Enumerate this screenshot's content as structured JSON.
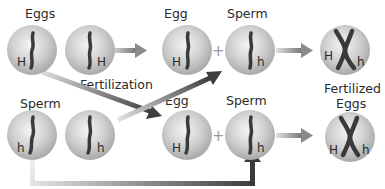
{
  "labels": {
    "eggs": "Eggs",
    "sperm_left": "Sperm",
    "fertilization": "Fertilization",
    "egg_top": "Egg",
    "sperm_top": "Sperm",
    "egg_bottom": "Egg",
    "sperm_bottom": "Sperm",
    "fertilized_line1": "Fertilized",
    "fertilized_line2": "Eggs",
    "plus": "+"
  },
  "cells": {
    "egg1": {
      "allele": "H"
    },
    "egg2": {
      "allele": "H"
    },
    "sperm1": {
      "allele": "h"
    },
    "sperm2": {
      "allele": "h"
    },
    "top_egg": {
      "allele": "H"
    },
    "top_sperm": {
      "allele": "h"
    },
    "bottom_egg": {
      "allele": "H"
    },
    "bottom_sperm": {
      "allele": "h"
    },
    "zygote_top": {
      "allele_left": "H",
      "allele_right": "h"
    },
    "zygote_bottom": {
      "allele_left": "H",
      "allele_right": "h"
    }
  },
  "colors": {
    "sphere_light": "#f2f2f2",
    "sphere_mid": "#cfcfcf",
    "sphere_dark": "#a8a8a8",
    "chromosome": "#3a3a3a",
    "arrow_light": "#d4d4d4",
    "arrow_dark": "#4a4a4a"
  }
}
